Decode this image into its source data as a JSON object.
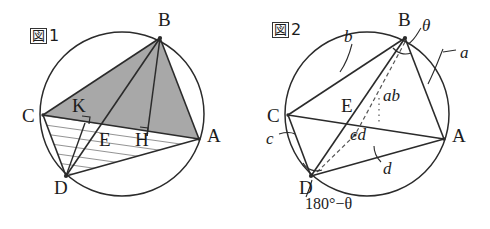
{
  "page": {
    "background": "#ffffff",
    "stroke_color": "#2b2b2b",
    "shade_color": "#a8a8a8",
    "hatch_color": "#3a3a3a"
  },
  "figure1": {
    "tag_kanji": "図",
    "tag_number": "1",
    "description": "Circle with inscribed points A, B, C, D; triangle ABC shaded; triangle ACD hatched; K and H right angle feet; E diagonal intersection",
    "points": [
      {
        "name": "A",
        "label": "A",
        "cx": 199,
        "cy": 139,
        "label_x": 207,
        "label_y": 128
      },
      {
        "name": "B",
        "label": "B",
        "cx": 160,
        "cy": 38,
        "label_x": 158,
        "label_y": 10
      },
      {
        "name": "C",
        "label": "C",
        "cx": 43,
        "cy": 115,
        "label_x": 22,
        "label_y": 108
      },
      {
        "name": "D",
        "label": "D",
        "cx": 66,
        "cy": 176,
        "label_x": 54,
        "label_y": 180
      },
      {
        "name": "E",
        "label": "E",
        "cx": 110,
        "cy": 135,
        "label_x": 101,
        "label_y": 130
      },
      {
        "name": "H",
        "label": "H",
        "cx": 147,
        "cy": 136,
        "label_x": 137,
        "label_y": 131
      },
      {
        "name": "K",
        "label": "K",
        "cx": 85,
        "cy": 123,
        "label_x": 76,
        "label_y": 100
      }
    ],
    "circle": {
      "cx": 122,
      "cy": 114,
      "r": 82
    },
    "right_angle_marks": [
      "K",
      "H"
    ],
    "shaded_region": "triangle-ABC",
    "hatched_region": "triangle-ACD"
  },
  "figure2": {
    "tag_kanji": "図",
    "tag_number": "2",
    "description": "Same cyclic quadrilateral with arc labels a, b, c, d, angle theta at B, 180 minus theta at D, and dashed segments labelled ab and cd through E",
    "points": [
      {
        "name": "A",
        "label": "A",
        "cx": 444,
        "cy": 139,
        "label_x": 452,
        "label_y": 128
      },
      {
        "name": "B",
        "label": "B",
        "cx": 405,
        "cy": 38,
        "label_x": 400,
        "label_y": 10
      },
      {
        "name": "C",
        "label": "C",
        "cx": 288,
        "cy": 115,
        "label_x": 267,
        "label_y": 108
      },
      {
        "name": "D",
        "label": "D",
        "cx": 311,
        "cy": 176,
        "label_x": 299,
        "label_y": 180
      },
      {
        "name": "E",
        "label": "E",
        "cx": 355,
        "cy": 135,
        "label_x": 343,
        "label_y": 98
      }
    ],
    "circle": {
      "cx": 367,
      "cy": 114,
      "r": 82
    },
    "arc_labels": [
      {
        "name": "a",
        "text": "a",
        "x": 460,
        "y": 52
      },
      {
        "name": "b",
        "text": "b",
        "x": 344,
        "y": 36
      },
      {
        "name": "c",
        "text": "c",
        "x": 268,
        "y": 137
      },
      {
        "name": "d",
        "text": "d",
        "x": 385,
        "y": 165
      }
    ],
    "product_labels": [
      {
        "name": "ab",
        "text": "ab",
        "x": 385,
        "y": 94
      },
      {
        "name": "cd",
        "text": "cd",
        "x": 351,
        "y": 133
      }
    ],
    "angle_labels": [
      {
        "name": "theta",
        "text": "θ",
        "x": 424,
        "y": 21
      },
      {
        "name": "supplement",
        "text": "180°−θ",
        "x": 307,
        "y": 200
      }
    ]
  }
}
